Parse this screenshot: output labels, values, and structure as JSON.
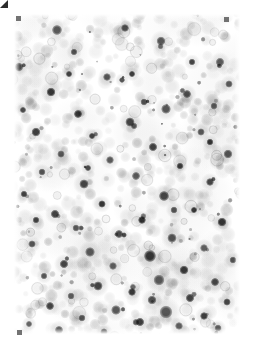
{
  "image": {
    "kind": "microscopy-field",
    "modality": "brightfield-light-microscopy",
    "specimen": "cytology smear",
    "title": "Microscopy Field",
    "width": 254,
    "height": 348,
    "background_color": "#ffffff",
    "margin_px": 14,
    "field": {
      "x": 14,
      "y": 14,
      "width": 226,
      "height": 320
    }
  },
  "palette": {
    "background": "#ffffff",
    "pale_cell": "#d9d9d9",
    "mid_cell": "#b4b4b4",
    "dark_nucleus": "#4a4a4a",
    "darkest_nucleus": "#2e2e2e",
    "haze": "#ededed",
    "registration_mark": "#4a4a4a"
  },
  "markers": [
    {
      "name": "registration-mark-top-left",
      "x": 16,
      "y": 16,
      "shape": "square"
    },
    {
      "name": "registration-mark-top-right",
      "x": 224,
      "y": 17,
      "shape": "square"
    },
    {
      "name": "registration-mark-bottom-left",
      "x": 17,
      "y": 330,
      "shape": "square"
    },
    {
      "name": "registration-mark-bottom-right",
      "x": 229,
      "y": 327,
      "shape": "triangle"
    }
  ],
  "render": {
    "seed": 20240517,
    "haze_blobs": 46,
    "pale_cells": 520,
    "mid_cells": 150,
    "dark_nuclei": 74,
    "pale_radius": [
      3.0,
      8.0
    ],
    "mid_radius": [
      3.0,
      7.0
    ],
    "dark_radius": [
      2.6,
      7.0
    ],
    "haze_radius": [
      14,
      40
    ],
    "vignette_strength": 0.12
  },
  "chart_data": {
    "type": "scatter",
    "xlabel": "x (px)",
    "ylabel": "y (px)",
    "xlim": [
      0,
      226
    ],
    "ylim": [
      0,
      320
    ],
    "grid": false,
    "legend": "none",
    "series": [
      {
        "name": "dark nuclei",
        "color": "#3a3a3a",
        "points": [
          [
            43,
            16,
            5.2
          ],
          [
            111,
            14,
            4.0
          ],
          [
            147,
            27,
            4.6
          ],
          [
            60,
            38,
            3.4
          ],
          [
            5,
            53,
            4.2
          ],
          [
            118,
            60,
            3.2
          ],
          [
            206,
            48,
            4.4
          ],
          [
            93,
            63,
            4.0
          ],
          [
            37,
            78,
            4.6
          ],
          [
            173,
            80,
            4.2
          ],
          [
            152,
            95,
            5.0
          ],
          [
            200,
            92,
            3.6
          ],
          [
            64,
            100,
            4.2
          ],
          [
            116,
            108,
            4.8
          ],
          [
            22,
            118,
            4.6
          ],
          [
            187,
            118,
            3.8
          ],
          [
            78,
            122,
            3.2
          ],
          [
            139,
            133,
            4.4
          ],
          [
            47,
            140,
            3.8
          ],
          [
            96,
            146,
            4.0
          ],
          [
            214,
            140,
            4.6
          ],
          [
            166,
            152,
            3.4
          ],
          [
            28,
            158,
            3.6
          ],
          [
            122,
            162,
            4.2
          ],
          [
            70,
            170,
            4.8
          ],
          [
            196,
            168,
            4.0
          ],
          [
            10,
            180,
            3.4
          ],
          [
            150,
            182,
            5.2
          ],
          [
            88,
            190,
            3.8
          ],
          [
            180,
            196,
            3.2
          ],
          [
            41,
            200,
            4.4
          ],
          [
            128,
            206,
            4.0
          ],
          [
            208,
            208,
            4.6
          ],
          [
            62,
            214,
            3.6
          ],
          [
            105,
            220,
            4.2
          ],
          [
            158,
            224,
            4.8
          ],
          [
            18,
            230,
            3.8
          ],
          [
            190,
            234,
            4.0
          ],
          [
            76,
            238,
            5.0
          ],
          [
            136,
            242,
            6.2
          ],
          [
            219,
            246,
            3.6
          ],
          [
            50,
            250,
            4.4
          ],
          [
            99,
            252,
            4.0
          ],
          [
            170,
            256,
            4.6
          ],
          [
            30,
            262,
            3.4
          ],
          [
            145,
            266,
            5.6
          ],
          [
            201,
            268,
            4.2
          ],
          [
            84,
            272,
            4.8
          ],
          [
            118,
            278,
            4.0
          ],
          [
            57,
            282,
            3.6
          ],
          [
            176,
            284,
            4.4
          ],
          [
            213,
            288,
            3.8
          ],
          [
            36,
            292,
            4.2
          ],
          [
            102,
            296,
            5.0
          ],
          [
            152,
            298,
            6.6
          ],
          [
            190,
            302,
            4.0
          ],
          [
            68,
            304,
            3.6
          ],
          [
            126,
            308,
            4.4
          ],
          [
            15,
            310,
            3.2
          ],
          [
            165,
            312,
            4.0
          ],
          [
            204,
            314,
            3.6
          ],
          [
            45,
            316,
            4.2
          ],
          [
            90,
            318,
            3.8
          ],
          [
            138,
            286,
            4.6
          ],
          [
            22,
            206,
            3.4
          ],
          [
            108,
            66,
            3.0
          ],
          [
            178,
            48,
            3.4
          ],
          [
            55,
            60,
            3.2
          ],
          [
            215,
            70,
            3.8
          ],
          [
            130,
            88,
            3.6
          ],
          [
            9,
            96,
            3.2
          ],
          [
            196,
            128,
            3.4
          ],
          [
            74,
            154,
            3.2
          ],
          [
            160,
            196,
            3.6
          ]
        ]
      },
      {
        "name": "pale cytoplasm / unstained cells",
        "color": "#d4d4d4",
        "count": 520
      }
    ]
  }
}
